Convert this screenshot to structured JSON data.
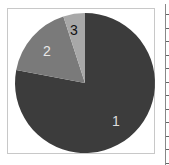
{
  "chart_data": {
    "type": "pie",
    "title": "",
    "categories": [
      "1",
      "2",
      "3"
    ],
    "values": [
      78,
      17,
      5
    ],
    "colors": [
      "#3c3c3c",
      "#7a7a7a",
      "#a8a8a8"
    ],
    "label_colors": [
      "#dddddd",
      "#e8e8e8",
      "#111111"
    ],
    "start_angle_deg": 0,
    "direction": "clockwise",
    "legend": null
  },
  "labels": {
    "s1": "1",
    "s2": "2",
    "s3": "3"
  }
}
